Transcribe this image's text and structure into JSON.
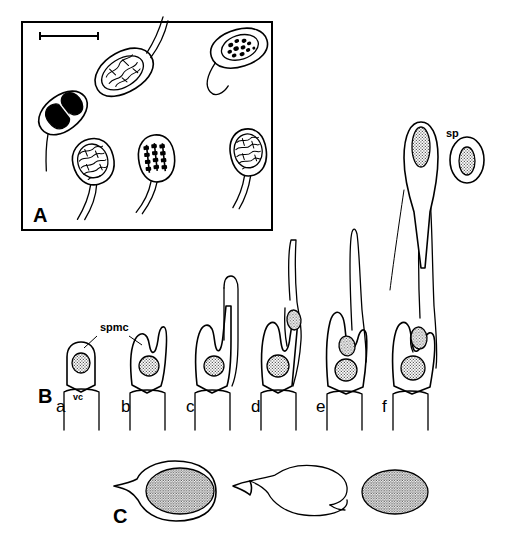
{
  "figure": {
    "background_color": "#ffffff",
    "ink_color": "#000000",
    "width": 507,
    "height": 559
  },
  "panels": [
    {
      "id": "A",
      "label": "A",
      "label_x": 33,
      "label_y": 222,
      "framed": true,
      "frame": {
        "x": 22,
        "y": 22,
        "width": 250,
        "height": 208
      },
      "scale_bar": {
        "x1": 40,
        "x2": 98,
        "y": 36,
        "tick_height": 8
      },
      "description": "Stained spermatogenous cells with nuclei at various stages of condensation",
      "cells": [
        {
          "name": "cell-reticulate-upper",
          "nucleus_style": "reticulate",
          "cx": 122,
          "cy": 72,
          "rx": 22,
          "ry": 15,
          "angle": -30,
          "tail_len": 40
        },
        {
          "name": "cell-clumped-upperright",
          "nucleus_style": "clumped",
          "cx": 236,
          "cy": 47,
          "rx": 20,
          "ry": 14,
          "angle": -20,
          "tail_len": 34
        },
        {
          "name": "cell-condensed-dark",
          "nucleus_style": "solid",
          "cx": 62,
          "cy": 113,
          "rx": 18,
          "ry": 13,
          "angle": -36,
          "tail_len": 38
        },
        {
          "name": "cell-reticulate-lower",
          "nucleus_style": "reticulate",
          "cx": 93,
          "cy": 166,
          "rx": 17,
          "ry": 15,
          "angle": -20,
          "tail_len": 46
        },
        {
          "name": "cell-chromosome-bands",
          "nucleus_style": "bands",
          "cx": 155,
          "cy": 162,
          "rx": 16,
          "ry": 16,
          "angle": -10,
          "tail_len": 40
        },
        {
          "name": "cell-reticulate-right",
          "nucleus_style": "reticulate",
          "cx": 247,
          "cy": 157,
          "rx": 16,
          "ry": 16,
          "angle": -12,
          "tail_len": 40
        }
      ]
    },
    {
      "id": "B",
      "label": "B",
      "label_x": 38,
      "label_y": 403,
      "framed": false,
      "description": "Six successive stages of spermatozoid formation within the spermatocyte on a vegetative cell",
      "annotations": [
        {
          "name": "spmc",
          "text": "spmc",
          "x": 100,
          "y": 330,
          "leader_targets": [
            [
              84,
              348
            ],
            [
              141,
              345
            ]
          ]
        },
        {
          "name": "vc",
          "text": "vc",
          "x": 79,
          "y": 400
        }
      ],
      "stages": [
        {
          "letter": "a",
          "x": 62,
          "y": 412,
          "stage_index": 1,
          "flagellum_length": 0
        },
        {
          "letter": "b",
          "x": 127,
          "y": 412,
          "stage_index": 2,
          "flagellum_length": 48
        },
        {
          "letter": "c",
          "x": 192,
          "y": 412,
          "stage_index": 3,
          "flagellum_length": 100
        },
        {
          "letter": "d",
          "x": 258,
          "y": 412,
          "stage_index": 4,
          "flagellum_length": 145
        },
        {
          "letter": "e",
          "x": 323,
          "y": 412,
          "stage_index": 5,
          "flagellum_length": 190
        },
        {
          "letter": "f",
          "x": 388,
          "y": 412,
          "stage_index": 6,
          "flagellum_length": 248
        }
      ]
    },
    {
      "id": "C",
      "label": "C",
      "label_x": 113,
      "label_y": 523,
      "framed": false,
      "description": "Release of the nucleus from the spermatozoid envelope",
      "items": [
        {
          "name": "intact-spermatozoid",
          "cx": 175,
          "cy": 492
        },
        {
          "name": "opened-envelope",
          "cx": 297,
          "cy": 492
        },
        {
          "name": "free-nucleus",
          "cx": 395,
          "cy": 492
        }
      ]
    }
  ],
  "labels": {
    "sp": {
      "text": "sp",
      "x": 446,
      "y": 137,
      "refers_to": "free spermatozoid"
    }
  },
  "free_cell": {
    "name": "free-spermatozoid-sp",
    "cx": 467,
    "cy": 160
  }
}
